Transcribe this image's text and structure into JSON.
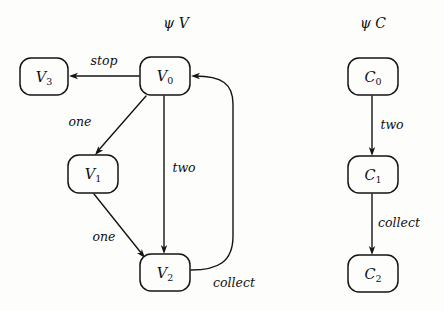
{
  "figure": {
    "background_color": "#fdfdfc",
    "ink_color": "#141414",
    "width": 444,
    "height": 311
  },
  "panels": [
    {
      "id": "psi-v",
      "title": "ψ V",
      "title_x": 176,
      "title_y": 24,
      "nodes": [
        {
          "id": "V3",
          "base": "V",
          "sub": "3",
          "x": 20,
          "y": 58,
          "w": 48,
          "h": 37
        },
        {
          "id": "V0",
          "base": "V",
          "sub": "0",
          "x": 140,
          "y": 57,
          "w": 50,
          "h": 38
        },
        {
          "id": "V1",
          "base": "V",
          "sub": "1",
          "x": 68,
          "y": 155,
          "w": 50,
          "h": 38
        },
        {
          "id": "V2",
          "base": "V",
          "sub": "2",
          "x": 140,
          "y": 254,
          "w": 50,
          "h": 37
        }
      ],
      "edges": [
        {
          "id": "v0-v3",
          "from": "V0",
          "to": "V3",
          "label": "stop",
          "label_x": 104,
          "label_y": 61,
          "path": "M 139 76 L 72 76",
          "arrow": {
            "x": 69,
            "y": 76,
            "angle": 180
          }
        },
        {
          "id": "v0-v1",
          "from": "V0",
          "to": "V1",
          "label": "one",
          "label_x": 80,
          "label_y": 122,
          "path": "M 146 96 L 97 152",
          "arrow": {
            "x": 95,
            "y": 155,
            "angle": 131
          }
        },
        {
          "id": "v0-v2",
          "from": "V0",
          "to": "V2",
          "label": "two",
          "label_x": 184,
          "label_y": 168,
          "path": "M 164 96 L 164 250",
          "arrow": {
            "x": 164,
            "y": 254,
            "angle": 90
          }
        },
        {
          "id": "v1-v2",
          "from": "V1",
          "to": "V2",
          "label": "one",
          "label_x": 104,
          "label_y": 237,
          "path": "M 94 194 L 142 254",
          "arrow": {
            "x": 145,
            "y": 258,
            "angle": 51
          }
        },
        {
          "id": "v2-v0",
          "from": "V2",
          "to": "V0",
          "label": "collect",
          "label_x": 234,
          "label_y": 283,
          "path": "M 191 270 C 218 270 233 262 233 236 L 233 104 C 233 84 222 76 195 76",
          "arrow": {
            "x": 191,
            "y": 76,
            "angle": 180
          }
        }
      ]
    },
    {
      "id": "psi-c",
      "title": "ψ C",
      "title_x": 373,
      "title_y": 24,
      "nodes": [
        {
          "id": "C0",
          "base": "C",
          "sub": "0",
          "x": 348,
          "y": 58,
          "w": 50,
          "h": 37
        },
        {
          "id": "C1",
          "base": "C",
          "sub": "1",
          "x": 348,
          "y": 156,
          "w": 50,
          "h": 37
        },
        {
          "id": "C2",
          "base": "C",
          "sub": "2",
          "x": 348,
          "y": 255,
          "w": 50,
          "h": 37
        }
      ],
      "edges": [
        {
          "id": "c0-c1",
          "from": "C0",
          "to": "C1",
          "label": "two",
          "label_x": 392,
          "label_y": 125,
          "path": "M 372 96 L 372 152",
          "arrow": {
            "x": 372,
            "y": 156,
            "angle": 90
          }
        },
        {
          "id": "c1-c2",
          "from": "C1",
          "to": "C2",
          "label": "collect",
          "label_x": 399,
          "label_y": 223,
          "path": "M 372 194 L 372 251",
          "arrow": {
            "x": 372,
            "y": 255,
            "angle": 90
          }
        }
      ]
    }
  ]
}
